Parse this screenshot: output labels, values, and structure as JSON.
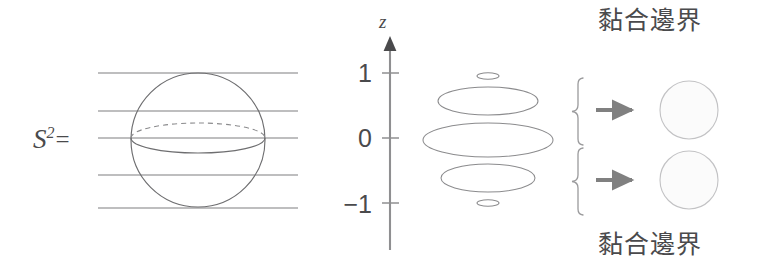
{
  "figure": {
    "title_none": "",
    "background_color": "#ffffff",
    "ink_color": "#58585a",
    "arrow_color": "#808080",
    "outline_color": "#9a9a9c"
  },
  "left_panel": {
    "sphere_label": "S",
    "sphere_label_exponent": "2",
    "sphere_label_equals": "=",
    "level_lines_count": 5,
    "equator_upper_style": "dashed",
    "equator_lower_style": "solid"
  },
  "axis": {
    "name": "z",
    "tick_labels": [
      "1",
      "0",
      "−1"
    ],
    "tick_values": [
      1,
      0,
      -1
    ],
    "direction": "up",
    "arrowhead": true
  },
  "slices": {
    "description": "stack of level-set circles of S^2 drawn as ellipses",
    "items": [
      {
        "z": "1",
        "label": "point-slice-top"
      },
      {
        "z": "0.5",
        "label": "circle-slice-upper"
      },
      {
        "z": "0",
        "label": "circle-slice-equator"
      },
      {
        "z": "-0.5",
        "label": "circle-slice-lower"
      },
      {
        "z": "-1",
        "label": "point-slice-bottom"
      }
    ]
  },
  "braces": [
    {
      "name": "upper-brace",
      "maps_to": "upper-quotient-disc"
    },
    {
      "name": "lower-brace",
      "maps_to": "lower-quotient-disc"
    }
  ],
  "arrows": [
    {
      "name": "upper-arrow",
      "glyph": "→"
    },
    {
      "name": "lower-arrow",
      "glyph": "→"
    }
  ],
  "quotient_discs": [
    {
      "name": "upper-disc"
    },
    {
      "name": "lower-disc"
    }
  ],
  "captions": {
    "top": "黏合邊界",
    "bottom": "黏合邊界"
  }
}
